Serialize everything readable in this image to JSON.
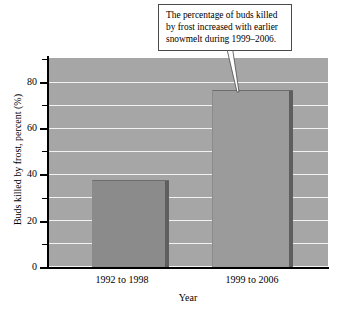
{
  "callout": {
    "text": "The percentage of buds killed by frost increased with earlier snowmelt during 1999–2006."
  },
  "chart_data": {
    "type": "bar",
    "title": "",
    "subtitle": "",
    "categories": [
      "1992 to 1998",
      "1999 to 2006"
    ],
    "values": [
      37,
      76
    ],
    "xlabel": "Year",
    "ylabel": "Buds killed by frost, percent (%)",
    "ylim": [
      0,
      90
    ],
    "ytick_labels": [
      "0",
      "20",
      "40",
      "60",
      "80"
    ],
    "ytick_values": [
      0,
      20,
      40,
      60,
      80
    ],
    "minor_tick_values": [
      10,
      30,
      50,
      70
    ],
    "gridlines": [
      10,
      20,
      30,
      40,
      50,
      60,
      70,
      80
    ],
    "grid": true,
    "legend": "none",
    "annotations": [
      {
        "text": "The percentage of buds killed by frost increased with earlier snowmelt during 1999–2006.",
        "points_to": "1999 to 2006"
      }
    ],
    "colors": {
      "plot_background": "#a6a6a6",
      "gridline": "#f2f2f2",
      "bar_1": "#8b8b8b",
      "bar_2": "#9b9b9b",
      "bar_shadow": "#5e5e5e",
      "axis": "#000000",
      "callout_background": "#ffffff",
      "callout_border": "#4a4a4a",
      "text": "#000000"
    }
  }
}
